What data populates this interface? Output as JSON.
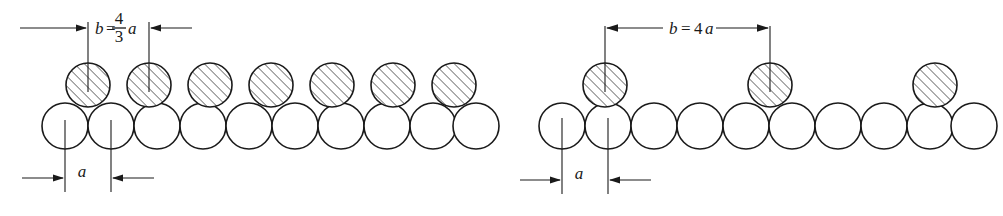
{
  "figure": {
    "kind": "crystal-lattice-epitaxy-diagram",
    "background_color": "#ffffff",
    "ink_color": "#1a1a1a"
  },
  "panels": [
    {
      "id": "left",
      "name": "panel-left",
      "substrate_circle_count": 10,
      "adsorbate_circle_count": 7,
      "substrate_diameter": 46,
      "adsorbate_diameter": 44,
      "top_dimension": {
        "symbol": "b",
        "equals": "=",
        "relation_kind": "fraction",
        "numerator": "4",
        "denominator": "3",
        "unit_symbol": "a",
        "full_text": "b = 4/3 a",
        "arrow_direction": "inward"
      },
      "bottom_dimension": {
        "symbol": "a",
        "full_text": "a",
        "arrow_direction": "inward",
        "measures": "substrate sphere spacing"
      }
    },
    {
      "id": "right",
      "name": "panel-right",
      "substrate_circle_count": 10,
      "adsorbate_circle_count": 3,
      "substrate_diameter": 46,
      "adsorbate_diameter": 44,
      "top_dimension": {
        "symbol": "b",
        "equals": "=",
        "relation_kind": "inline",
        "multiplier": "4",
        "unit_symbol": "a",
        "full_text": "b = 4 a",
        "arrow_direction": "outward"
      },
      "bottom_dimension": {
        "symbol": "a",
        "full_text": "a",
        "arrow_direction": "inward",
        "measures": "substrate sphere spacing"
      }
    }
  ],
  "hatching": {
    "angle_degrees": 45,
    "spacing": 5,
    "stroke_width": 1.0,
    "color": "#1a1a1a"
  },
  "geometry": {
    "left_panel": {
      "substrate_centers_x": [
        65,
        111,
        157,
        203,
        249,
        295,
        341,
        387,
        433,
        474
      ],
      "substrate_center_y": 126,
      "adsorbate_centers_x": [
        88,
        149,
        210,
        271,
        332,
        393,
        454
      ],
      "adsorbate_center_y": 85,
      "dim_b_left_x": 88,
      "dim_b_right_x": 149,
      "dim_b_line_y": 28,
      "dim_a_left_x": 65,
      "dim_a_right_x": 111,
      "dim_a_line_y": 178
    },
    "right_panel": {
      "substrate_centers_x": [
        562,
        608,
        654,
        700,
        746,
        792,
        838,
        884,
        930,
        972
      ],
      "substrate_center_y": 126,
      "adsorbate_centers_x": [
        605,
        770,
        935
      ],
      "adsorbate_center_y": 85,
      "dim_b_left_x": 605,
      "dim_b_right_x": 770,
      "dim_b_line_y": 28,
      "dim_a_left_x": 562,
      "dim_a_right_x": 608,
      "dim_a_line_y": 180
    }
  }
}
